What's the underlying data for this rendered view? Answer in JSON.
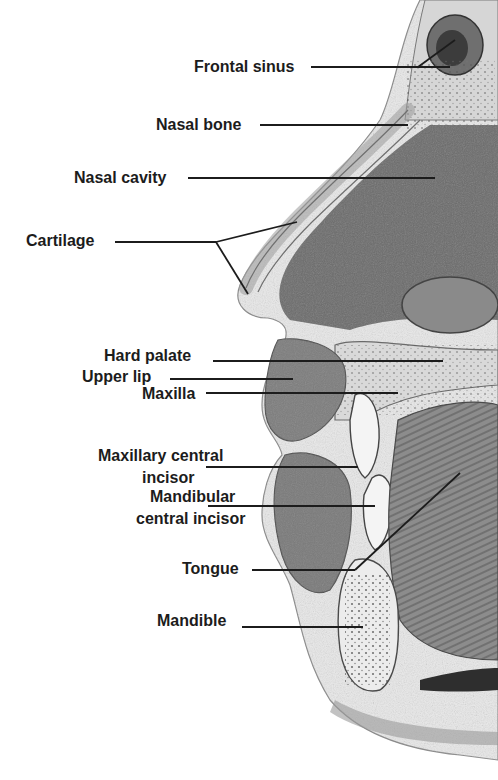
{
  "diagram": {
    "style": "grayscale pencil anatomical illustration",
    "labels": [
      {
        "id": "frontal-sinus",
        "text": "Frontal sinus"
      },
      {
        "id": "nasal-bone",
        "text": "Nasal bone"
      },
      {
        "id": "nasal-cavity",
        "text": "Nasal cavity"
      },
      {
        "id": "cartilage",
        "text": "Cartilage"
      },
      {
        "id": "hard-palate",
        "text": "Hard palate"
      },
      {
        "id": "upper-lip",
        "text": "Upper lip"
      },
      {
        "id": "maxilla",
        "text": "Maxilla"
      },
      {
        "id": "maxillary-central-incisor",
        "line1": "Maxillary central",
        "line2": "incisor"
      },
      {
        "id": "mandibular-central-incisor",
        "line1": "Mandibular",
        "line2": "central incisor"
      },
      {
        "id": "tongue",
        "text": "Tongue"
      },
      {
        "id": "mandible",
        "text": "Mandible"
      }
    ]
  }
}
